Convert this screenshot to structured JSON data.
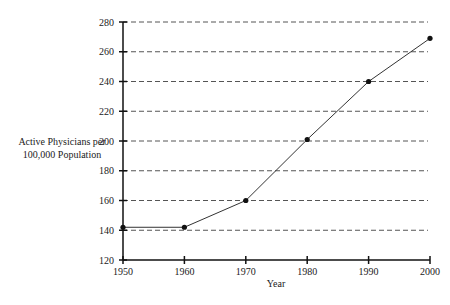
{
  "chart_data": {
    "type": "line",
    "title": "",
    "xlabel": "Year",
    "ylabel_lines": [
      "Active Physicians per",
      "100,000 Population"
    ],
    "x": [
      1950,
      1960,
      1970,
      1980,
      1990,
      2000
    ],
    "series": [
      {
        "name": "Active Physicians per 100,000 Population",
        "values": [
          142,
          142,
          160,
          201,
          240,
          269
        ]
      }
    ],
    "xlim": [
      1950,
      2000
    ],
    "ylim": [
      120,
      280
    ],
    "xticks": [
      "1950",
      "1960",
      "1970",
      "1980",
      "1990",
      "2000"
    ],
    "yticks": [
      "120",
      "140",
      "160",
      "180",
      "200",
      "220",
      "240",
      "260",
      "280"
    ],
    "grid": "horizontal-dashed",
    "legend": "none",
    "colors": {
      "line": "#333333",
      "marker": "#111111",
      "axis": "#111111",
      "grid": "#555555"
    }
  }
}
